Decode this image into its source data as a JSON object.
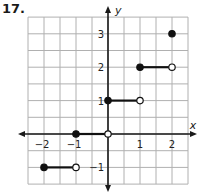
{
  "problem": {
    "number": "17."
  },
  "chart_data": {
    "type": "line",
    "title": "",
    "xlabel": "x",
    "ylabel": "y",
    "xlim": [
      -2.5,
      2.5
    ],
    "ylim": [
      -1.5,
      3.5
    ],
    "grid": true,
    "grid_step": 0.5,
    "x_ticks": [
      "-2",
      "-1",
      "1",
      "2"
    ],
    "y_ticks": [
      "3",
      "2",
      "1",
      "-1"
    ],
    "segments": [
      {
        "x_start": -2,
        "x_end": -1,
        "y": -1,
        "start_closed": true,
        "end_closed": false
      },
      {
        "x_start": -1,
        "x_end": 0,
        "y": 0,
        "start_closed": true,
        "end_closed": false
      },
      {
        "x_start": 0,
        "x_end": 1,
        "y": 1,
        "start_closed": true,
        "end_closed": false
      },
      {
        "x_start": 1,
        "x_end": 2,
        "y": 2,
        "start_closed": true,
        "end_closed": false
      }
    ],
    "isolated_points": [
      {
        "x": 2,
        "y": 3,
        "closed": true
      }
    ],
    "colors": {
      "grid": "#b0b0b0",
      "axis": "#1a1a1a",
      "curve": "#111111",
      "background": "#ffffff"
    }
  }
}
